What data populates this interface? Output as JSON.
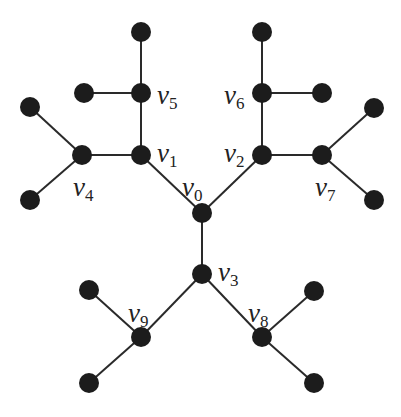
{
  "diagram": {
    "type": "tree",
    "colors": {
      "node": "#1c1c1c",
      "edge": "#2a2a2a",
      "label": "#222222",
      "background": "#ffffff"
    },
    "nodes": [
      {
        "id": "v0",
        "label": "v",
        "sub": "0",
        "x": 202,
        "y": 213,
        "lx": 182,
        "ly": 196
      },
      {
        "id": "v1",
        "label": "v",
        "sub": "1",
        "x": 141,
        "y": 155,
        "lx": 157,
        "ly": 162
      },
      {
        "id": "v2",
        "label": "v",
        "sub": "2",
        "x": 262,
        "y": 155,
        "lx": 224,
        "ly": 162
      },
      {
        "id": "v3",
        "label": "v",
        "sub": "3",
        "x": 202,
        "y": 274,
        "lx": 218,
        "ly": 281
      },
      {
        "id": "v4",
        "label": "v",
        "sub": "4",
        "x": 82,
        "y": 155,
        "lx": 73,
        "ly": 196
      },
      {
        "id": "v5",
        "label": "v",
        "sub": "5",
        "x": 141,
        "y": 93,
        "lx": 157,
        "ly": 104
      },
      {
        "id": "v6",
        "label": "v",
        "sub": "6",
        "x": 262,
        "y": 93,
        "lx": 224,
        "ly": 104
      },
      {
        "id": "v7",
        "label": "v",
        "sub": "7",
        "x": 322,
        "y": 155,
        "lx": 315,
        "ly": 196
      },
      {
        "id": "v8",
        "label": "v",
        "sub": "8",
        "x": 262,
        "y": 337,
        "lx": 248,
        "ly": 322
      },
      {
        "id": "v9",
        "label": "v",
        "sub": "9",
        "x": 141,
        "y": 337,
        "lx": 128,
        "ly": 322
      },
      {
        "id": "l1",
        "x": 141,
        "y": 32
      },
      {
        "id": "l2",
        "x": 84,
        "y": 93
      },
      {
        "id": "l3",
        "x": 30,
        "y": 107
      },
      {
        "id": "l4",
        "x": 30,
        "y": 200
      },
      {
        "id": "l5",
        "x": 262,
        "y": 32
      },
      {
        "id": "l6",
        "x": 322,
        "y": 93
      },
      {
        "id": "l7",
        "x": 374,
        "y": 108
      },
      {
        "id": "l8",
        "x": 374,
        "y": 200
      },
      {
        "id": "l9",
        "x": 89,
        "y": 290
      },
      {
        "id": "l10",
        "x": 89,
        "y": 383
      },
      {
        "id": "l11",
        "x": 314,
        "y": 291
      },
      {
        "id": "l12",
        "x": 314,
        "y": 383
      }
    ],
    "edges": [
      [
        "v0",
        "v1"
      ],
      [
        "v0",
        "v2"
      ],
      [
        "v0",
        "v3"
      ],
      [
        "v1",
        "v5"
      ],
      [
        "v1",
        "v4"
      ],
      [
        "v2",
        "v6"
      ],
      [
        "v2",
        "v7"
      ],
      [
        "v3",
        "v9"
      ],
      [
        "v3",
        "v8"
      ],
      [
        "v5",
        "l1"
      ],
      [
        "v5",
        "l2"
      ],
      [
        "v4",
        "l3"
      ],
      [
        "v4",
        "l4"
      ],
      [
        "v6",
        "l5"
      ],
      [
        "v6",
        "l6"
      ],
      [
        "v7",
        "l7"
      ],
      [
        "v7",
        "l8"
      ],
      [
        "v9",
        "l9"
      ],
      [
        "v9",
        "l10"
      ],
      [
        "v8",
        "l11"
      ],
      [
        "v8",
        "l12"
      ]
    ],
    "node_radius": 10
  }
}
